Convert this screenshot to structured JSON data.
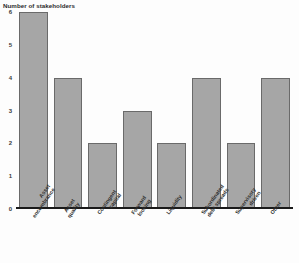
{
  "chart_data": {
    "type": "bar",
    "title": "Number of stakeholders",
    "xlabel": "",
    "ylabel": "",
    "ylim": [
      0,
      6
    ],
    "yticks": [
      "0",
      "1",
      "2",
      "3",
      "4",
      "5",
      "6"
    ],
    "grid": false,
    "legend": "none",
    "bar_color": "#a6a6a6",
    "bar_border_color": "#6a6a6a",
    "axis_color": "#1a1a1a",
    "categories": [
      "Asset encumbrance",
      "Asset quality",
      "Contingent capital",
      "Forward looking",
      "Liquidity",
      "Subordinated debt spreads",
      "Supervisory driven",
      "Other"
    ],
    "category_lines": [
      [
        "Asset",
        "encumbrance"
      ],
      [
        "Asset",
        "quality"
      ],
      [
        "Contingent",
        "capital"
      ],
      [
        "Forward",
        "looking"
      ],
      [
        "Liquidity",
        ""
      ],
      [
        "Subordinated",
        "debt spreads"
      ],
      [
        "Supervisory",
        "driven"
      ],
      [
        "Other",
        ""
      ]
    ],
    "values": [
      6,
      4,
      2,
      3,
      2,
      4,
      2,
      4
    ]
  }
}
